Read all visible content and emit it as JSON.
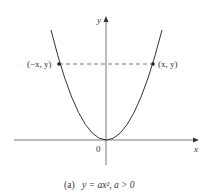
{
  "figure": {
    "caption_prefix": "(a)",
    "caption_equation": "y = ax², a > 0",
    "axes": {
      "x_label": "x",
      "y_label": "y",
      "origin_label": "0"
    },
    "points": [
      {
        "label": "(−x, y)"
      },
      {
        "label": "(x, y)"
      }
    ],
    "colors": {
      "curve": "#333333",
      "axes": "#555555",
      "dashed": "#555555"
    }
  }
}
